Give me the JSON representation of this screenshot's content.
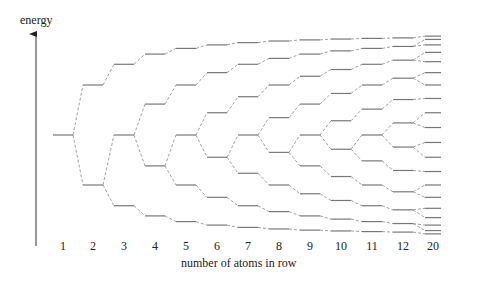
{
  "diagram": {
    "y_axis_label": "energy",
    "x_axis_label": "number of atoms in row",
    "columns": [
      {
        "label": "1",
        "n": 1,
        "x": 63
      },
      {
        "label": "2",
        "n": 2,
        "x": 93
      },
      {
        "label": "3",
        "n": 3,
        "x": 124
      },
      {
        "label": "4",
        "n": 4,
        "x": 155
      },
      {
        "label": "5",
        "n": 5,
        "x": 186
      },
      {
        "label": "6",
        "n": 6,
        "x": 217
      },
      {
        "label": "7",
        "n": 7,
        "x": 248
      },
      {
        "label": "8",
        "n": 8,
        "x": 279
      },
      {
        "label": "9",
        "n": 9,
        "x": 310
      },
      {
        "label": "10",
        "n": 10,
        "x": 341
      },
      {
        "label": "11",
        "n": 11,
        "x": 372
      },
      {
        "label": "12",
        "n": 12,
        "x": 403
      },
      {
        "label": "20",
        "n": 20,
        "x": 433
      }
    ],
    "level_formula": "E_k = 2cos(k*pi/(N+1)), k=1..N",
    "center_y": 135,
    "scale_px_per_beta": 50,
    "level_half_width": 10,
    "colors": {
      "level": "#777777",
      "connector": "#888888",
      "axis": "#333333",
      "text": "#222222"
    }
  }
}
